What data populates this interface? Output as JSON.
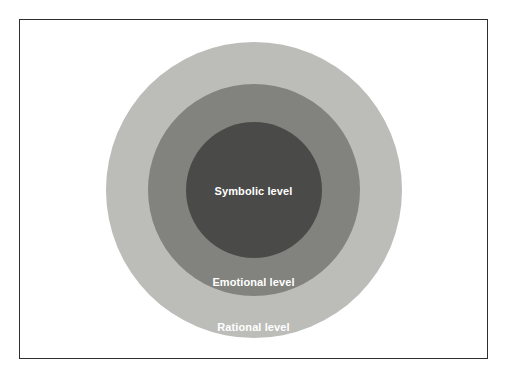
{
  "diagram": {
    "type": "concentric-circles",
    "frame": {
      "border_color": "#2f2f2f",
      "background_color": "#ffffff"
    },
    "rings": [
      {
        "id": "rational",
        "label": "Rational level",
        "color": "#bcbdb8",
        "order": 1,
        "position": "outer"
      },
      {
        "id": "emotional",
        "label": "Emotional level",
        "color": "#82837e",
        "order": 2,
        "position": "middle"
      },
      {
        "id": "symbolic",
        "label": "Symbolic level",
        "color": "#4a4a48",
        "order": 3,
        "position": "inner"
      }
    ],
    "label_color": "#ffffff"
  }
}
